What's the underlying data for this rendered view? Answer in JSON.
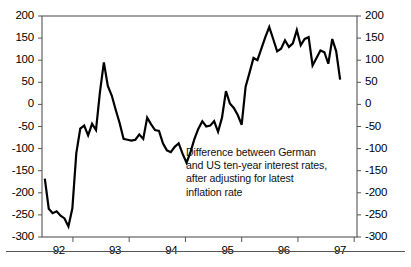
{
  "chart_data": {
    "type": "line",
    "title": "",
    "subtitle": "",
    "xlabel": "",
    "ylabel": "",
    "annotation": [
      "Difference between German",
      "and US ten-year interest rates,",
      "after adjusting for latest",
      "inflation rate"
    ],
    "annotation_text": "Difference between German and US ten-year interest rates, after adjusting for latest inflation rate",
    "grid": false,
    "legend": "none",
    "line_color": "#000000",
    "line_width": 2.2,
    "background": "#ffffff",
    "axis_color": "#555555",
    "ylim": [
      -300,
      200
    ],
    "yticks": [
      200,
      150,
      100,
      50,
      0,
      -50,
      -100,
      -150,
      -200,
      -250,
      -300
    ],
    "ytick_labels_left": [
      "200",
      "150",
      "100",
      "50",
      "0",
      "-50",
      "-100",
      "-150",
      "-200",
      "-250",
      "-300"
    ],
    "ytick_labels_right": [
      "200",
      "150",
      "100",
      "50",
      "0",
      "-50",
      "-100",
      "-150",
      "-200",
      "-250",
      "-300"
    ],
    "y_axis_left_visible": true,
    "y_axis_right_visible": true,
    "xlim": [
      1991.45,
      1997.05
    ],
    "xticks": [
      1992,
      1993,
      1994,
      1995,
      1996,
      1997
    ],
    "xtick_labels": [
      "92",
      "93",
      "94",
      "95",
      "96",
      "97"
    ],
    "xtick_label_positions": [
      1991.75,
      1992.75,
      1993.75,
      1994.75,
      1995.75,
      1996.75
    ],
    "series": [
      {
        "name": "German minus US real ten-year yield",
        "x": [
          1991.5,
          1991.58,
          1991.66,
          1991.74,
          1991.82,
          1991.9,
          1991.98,
          1992.06,
          1992.14,
          1992.22,
          1992.3,
          1992.38,
          1992.46,
          1992.54,
          1992.62,
          1992.7,
          1992.78,
          1992.86,
          1992.94,
          1993.02,
          1993.1,
          1993.18,
          1993.26,
          1993.34,
          1993.42,
          1993.5,
          1993.58,
          1993.66,
          1993.74,
          1993.82,
          1993.9,
          1993.98,
          1994.06,
          1994.14,
          1994.22,
          1994.3,
          1994.38,
          1994.46,
          1994.54,
          1994.62,
          1994.7,
          1994.78,
          1994.86,
          1994.94,
          1995.02,
          1995.1,
          1995.18,
          1995.26,
          1995.34,
          1995.42,
          1995.5,
          1995.58,
          1995.66,
          1995.74,
          1995.82,
          1995.9,
          1995.98,
          1996.06,
          1996.14,
          1996.22,
          1996.3,
          1996.38,
          1996.46,
          1996.54,
          1996.62,
          1996.7,
          1996.78
        ],
        "values": [
          -168,
          -238,
          -246,
          -243,
          -252,
          -255,
          -275,
          -190,
          -62,
          -48,
          -68,
          -42,
          -60,
          95,
          42,
          22,
          -10,
          -48,
          -78,
          -80,
          -82,
          -70,
          -78,
          -30,
          -62,
          -60,
          -86,
          -100,
          -108,
          -98,
          -86,
          -108,
          -132,
          -110,
          -76,
          -52,
          -38,
          -52,
          -40,
          -62,
          -30,
          30,
          -6,
          -10,
          -25,
          -46,
          45,
          74,
          105,
          100,
          128,
          152,
          175,
          150,
          122,
          128,
          145,
          132,
          140,
          168,
          136,
          150,
          152,
          88,
          108,
          122,
          118
        ],
        "values_tail": [
          95,
          118,
          150,
          120,
          92,
          56,
          50,
          30,
          28,
          -22
        ]
      }
    ],
    "series_full": {
      "x": [
        1991.5,
        1991.57,
        1991.64,
        1991.71,
        1991.78,
        1991.85,
        1991.92,
        1991.99,
        1992.06,
        1992.13,
        1992.2,
        1992.27,
        1992.34,
        1992.41,
        1992.48,
        1992.55,
        1992.62,
        1992.69,
        1992.76,
        1992.83,
        1992.9,
        1992.97,
        1993.04,
        1993.11,
        1993.18,
        1993.25,
        1993.32,
        1993.39,
        1993.46,
        1993.53,
        1993.6,
        1993.67,
        1993.74,
        1993.81,
        1993.88,
        1993.95,
        1994.02,
        1994.09,
        1994.16,
        1994.23,
        1994.3,
        1994.37,
        1994.44,
        1994.51,
        1994.58,
        1994.65,
        1994.72,
        1994.79,
        1994.86,
        1994.93,
        1995.0,
        1995.07,
        1995.14,
        1995.21,
        1995.28,
        1995.35,
        1995.42,
        1995.49,
        1995.56,
        1995.63,
        1995.7,
        1995.77,
        1995.84,
        1995.91,
        1995.98,
        1996.05,
        1996.12,
        1996.19,
        1996.26,
        1996.33,
        1996.4,
        1996.47,
        1996.54,
        1996.61,
        1996.68,
        1996.75
      ],
      "y": [
        -168,
        -236,
        -246,
        -242,
        -252,
        -258,
        -276,
        -235,
        -110,
        -55,
        -48,
        -70,
        -44,
        -58,
        28,
        95,
        42,
        20,
        -12,
        -42,
        -78,
        -80,
        -82,
        -80,
        -68,
        -78,
        -30,
        -45,
        -58,
        -60,
        -88,
        -104,
        -108,
        -96,
        -88,
        -112,
        -132,
        -108,
        -78,
        -55,
        -38,
        -50,
        -48,
        -38,
        -62,
        -30,
        30,
        2,
        -8,
        -24,
        -46,
        40,
        72,
        105,
        100,
        126,
        152,
        175,
        148,
        120,
        126,
        145,
        130,
        138,
        168,
        134,
        148,
        152,
        88,
        105,
        122,
        118,
        92,
        148,
        120,
        56
      ]
    }
  },
  "plot": {
    "left_px": 42,
    "right_px": 357,
    "top_px": 16,
    "bottom_px": 237
  }
}
